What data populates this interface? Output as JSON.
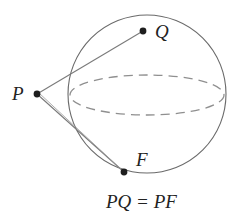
{
  "figure": {
    "sphere": {
      "cx": 147,
      "cy": 94,
      "r": 78,
      "stroke": "#6a6a6a"
    },
    "equator": {
      "cx": 147,
      "cy": 95,
      "rx": 77,
      "ry": 20,
      "stroke": "#8c8c8c",
      "dash": "9 6"
    },
    "points": {
      "P": {
        "label": "P",
        "x": 37,
        "y": 94
      },
      "Q": {
        "label": "Q",
        "x": 143,
        "y": 31
      },
      "F": {
        "label": "F",
        "x": 124,
        "y": 172
      }
    },
    "segments": [
      {
        "from": "P",
        "to": "Q"
      },
      {
        "from": "P",
        "to": "F"
      }
    ],
    "caption": "PQ = PF",
    "colors": {
      "line": "#7a7a7a",
      "point": "#1e1e1e",
      "text": "#222222"
    }
  }
}
